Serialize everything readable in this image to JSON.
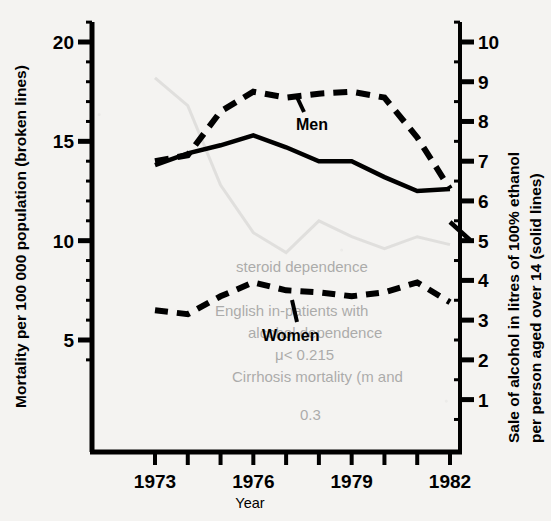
{
  "chart_data": {
    "type": "line",
    "title": "",
    "xlabel": "Year",
    "ylabel": "Mortality per 100 000 population (broken lines)",
    "y2label": "Sale of alcohol in litres of 100% ethanol per person aged over 14 (solid lines)",
    "x": [
      1973,
      1974,
      1975,
      1976,
      1977,
      1978,
      1979,
      1980,
      1981,
      1982
    ],
    "xlim": [
      1973,
      1982
    ],
    "ylim": [
      0,
      21.5
    ],
    "y2lim": [
      0,
      10.75
    ],
    "yticks": [
      5,
      10,
      15,
      20
    ],
    "yticklabels": [
      "5",
      "10",
      "15",
      "20"
    ],
    "y2ticks": [
      1,
      2,
      3,
      4,
      5,
      6,
      7,
      8,
      9,
      10
    ],
    "y2ticklabels": [
      "1",
      "2",
      "3",
      "4",
      "5",
      "6",
      "7",
      "8",
      "9",
      "10"
    ],
    "xticks": [
      1973,
      1974,
      1975,
      1976,
      1977,
      1978,
      1979,
      1980,
      1981,
      1982
    ],
    "xticklabels": [
      "1973",
      "",
      "",
      "1976",
      "",
      "",
      "1979",
      "",
      "",
      "1982"
    ],
    "grid": false,
    "legend": "inline-annotations",
    "series": [
      {
        "name": "Men",
        "label": "Men",
        "style": "dashed",
        "axis": "left",
        "unit": "mortality per 100 000",
        "values": [
          14.0,
          14.3,
          16.5,
          17.5,
          17.2,
          17.4,
          17.5,
          17.2,
          15.2,
          12.6
        ]
      },
      {
        "name": "Men alcohol",
        "label": "",
        "style": "solid",
        "axis": "right",
        "unit": "litres of 100% ethanol",
        "values": [
          6.9,
          7.2,
          7.4,
          7.65,
          7.35,
          7.0,
          7.0,
          6.6,
          6.25,
          6.3
        ]
      },
      {
        "name": "Women",
        "label": "Women",
        "style": "dashed",
        "axis": "left",
        "unit": "mortality per 100 000",
        "values": [
          6.5,
          6.3,
          7.2,
          7.9,
          7.5,
          7.4,
          7.2,
          7.4,
          7.9,
          6.9
        ]
      },
      {
        "name": "Women alcohol",
        "label": "",
        "style": "solid-faint",
        "axis": "right",
        "unit": "litres of 100% ethanol",
        "values": [
          9.1,
          8.4,
          6.4,
          5.2,
          4.7,
          5.5,
          5.1,
          4.8,
          5.1,
          4.9
        ]
      }
    ],
    "annotations": [
      {
        "text": "Men",
        "x": 1977.2,
        "y": 16.1,
        "leader": true
      },
      {
        "text": "Women",
        "x": 1976.6,
        "y": 5.85,
        "leader": true
      }
    ],
    "colors": {
      "ink": "#000000",
      "paper": "#f4f3f1",
      "faint": "#bfbdba"
    }
  },
  "axes": {
    "left_title": "Mortality per 100 000 population (broken lines)",
    "right_title_line1": "Sale of alcohol in litres of 100% ethanol",
    "right_title_line2": "per person aged over 14 (solid lines)",
    "x_title": "Year"
  },
  "labels": {
    "men": "Men",
    "women": "Women"
  },
  "ticks": {
    "left": [
      "20",
      "15",
      "10",
      "5"
    ],
    "right": [
      "10",
      "9",
      "8",
      "7",
      "6",
      "5",
      "4",
      "3",
      "2",
      "1"
    ],
    "x": [
      "1973",
      "1976",
      "1979",
      "1982"
    ]
  },
  "bleedthrough": {
    "l1": "steroid dependence",
    "l2": "English in-patients with",
    "l3": "alcohol dependence",
    "l4": "μ< 0.215",
    "l5": "Cirrhosis mortality (m and",
    "l6": "0.3"
  }
}
